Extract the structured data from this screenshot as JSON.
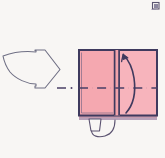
{
  "figure": {
    "background_color": "#f8f6f4",
    "description": "A step in an origami instruction sequence: an outlined arrow on the left points right toward a pink square of folded paper; a curved arrow inside the square shows a right panel folding up over the vertical center crease, a dash-dot horizontal line marks the mountain/valley axis, and a small tab with a curved arc sits below the bottom edge."
  },
  "palette": {
    "paper_fill": "#f5a8b0",
    "paper_fill_light": "#f7b4bc",
    "paper_outline": "#3f3a5e",
    "paper_shadow": "#c49aae",
    "guide_arrow_stroke": "#6f6f84",
    "fold_arrow_stroke": "#3f3a5e",
    "dash_dot_stroke": "#4a3f66",
    "corner_mark": "#5b5570"
  },
  "elements": {
    "guide_arrow": {
      "name": "Step progression arrow",
      "direction": "right",
      "style": "outline",
      "stroke_width": 1.1,
      "bounds": {
        "x": 2,
        "y": 49,
        "width": 60,
        "height": 40
      }
    },
    "paper_square": {
      "name": "Folded paper square",
      "bounds": {
        "x": 78,
        "y": 49,
        "width": 80,
        "height": 67
      },
      "stroke_width": 2
    },
    "vertical_crease": {
      "name": "Vertical center crease",
      "x_left": 114,
      "x_right": 119,
      "y_top": 49,
      "y_bottom": 116
    },
    "fold_arrow": {
      "name": "Fold-up curved arrow",
      "head_direction": "up",
      "stroke_width": 1.6
    },
    "axis_line": {
      "name": "Dash-dot symmetry axis",
      "y": 88,
      "x_start": 57,
      "x_end": 158,
      "pattern": "dash-dot"
    },
    "bottom_tab": {
      "name": "Lower paper tab with rotation arc",
      "bounds": {
        "x": 88,
        "y": 116,
        "width": 32,
        "height": 18
      }
    },
    "bottom_shadow": {
      "name": "Lower edge thickness band",
      "y": 116,
      "height": 4
    },
    "corner_mark": {
      "name": "Scan artifact mark",
      "x": 152,
      "y": 2,
      "width": 8,
      "height": 8
    }
  },
  "labels": {
    "step_text": "",
    "annotation": ""
  }
}
